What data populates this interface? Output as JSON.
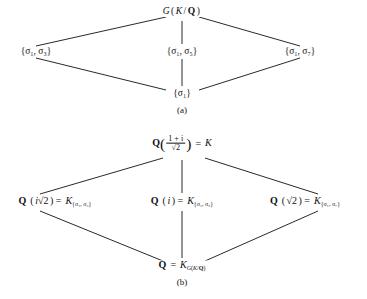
{
  "figure": {
    "background_color": "#ffffff",
    "line_color": "#111111",
    "text_color": "#111111"
  },
  "diagram_a": {
    "caption": "(a)",
    "top": {
      "label": "G(K/Q)",
      "group": "G",
      "field_ext": "K/Q"
    },
    "middle": [
      {
        "label": "{σ₁, σ₃}",
        "elements": [
          "σ₁",
          "σ₃"
        ]
      },
      {
        "label": "{σ₁, σ₅}",
        "elements": [
          "σ₁",
          "σ₅"
        ]
      },
      {
        "label": "{σ₁, σ₇}",
        "elements": [
          "σ₁",
          "σ₇"
        ]
      }
    ],
    "bottom": {
      "label": "{σ₁}",
      "elements": [
        "σ₁"
      ]
    },
    "edges": [
      [
        "top",
        "middle-left"
      ],
      [
        "top",
        "middle-center"
      ],
      [
        "top",
        "middle-right"
      ],
      [
        "middle-left",
        "bottom"
      ],
      [
        "middle-center",
        "bottom"
      ],
      [
        "middle-right",
        "bottom"
      ]
    ]
  },
  "diagram_b": {
    "caption": "(b)",
    "top": {
      "label": "Q((1 + i)/√2) = K",
      "base": "Q",
      "numerator": "1 + i",
      "denominator": "√2",
      "equals": "=",
      "field": "K"
    },
    "middle": [
      {
        "label": "Q(i√2) = K{σ₁, σ₃}",
        "base": "Q",
        "generator": "i√2",
        "equals": "=",
        "fixed_field": "K",
        "subscript": "{σ₁, σ₃}"
      },
      {
        "label": "Q(i) = K{σ₁, σ₅}",
        "base": "Q",
        "generator": "i",
        "equals": "=",
        "fixed_field": "K",
        "subscript": "{σ₁, σ₅}"
      },
      {
        "label": "Q(√2) = K{σ₁, σ₇}",
        "base": "Q",
        "generator": "√2",
        "equals": "=",
        "fixed_field": "K",
        "subscript": "{σ₁, σ₇}"
      }
    ],
    "bottom": {
      "label": "Q = KG(K/Q)",
      "base": "Q",
      "equals": "=",
      "fixed_field": "K",
      "subscript": "G(K/Q)"
    },
    "edges": [
      [
        "top",
        "middle-left"
      ],
      [
        "top",
        "middle-center"
      ],
      [
        "top",
        "middle-right"
      ],
      [
        "middle-left",
        "bottom"
      ],
      [
        "middle-center",
        "bottom"
      ],
      [
        "middle-right",
        "bottom"
      ]
    ]
  }
}
